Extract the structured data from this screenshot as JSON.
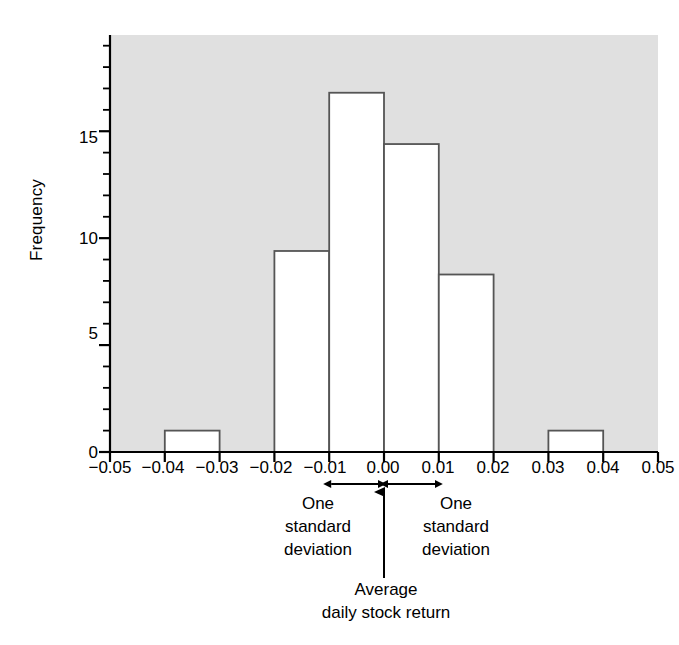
{
  "chart_data": {
    "type": "bar",
    "title": "",
    "subtitle": "",
    "xlabel": "",
    "ylabel": "Frequency",
    "grid": false,
    "legend": null,
    "xlim": [
      -0.05,
      0.05
    ],
    "ylim": [
      0,
      19.5
    ],
    "bin_width": 0.01,
    "x_tick_labels": [
      "−0.05",
      "−0.04",
      "−0.03",
      "−0.02",
      "−0.01",
      "0.00",
      "0.01",
      "0.02",
      "0.03",
      "0.04",
      "0.05"
    ],
    "x_tick_values": [
      -0.05,
      -0.04,
      -0.03,
      -0.02,
      -0.01,
      0.0,
      0.01,
      0.02,
      0.03,
      0.04,
      0.05
    ],
    "y_tick_labels": [
      "0",
      "5",
      "10",
      "15"
    ],
    "y_tick_values": [
      0,
      5,
      10,
      15
    ],
    "y_minor_tick_step": 1,
    "categories": [
      "−0.05 to −0.04",
      "−0.04 to −0.03",
      "−0.03 to −0.02",
      "−0.02 to −0.01",
      "−0.01 to 0.00",
      "0.00 to 0.01",
      "0.01 to 0.02",
      "0.02 to 0.03",
      "0.03 to 0.04",
      "0.04 to 0.05"
    ],
    "bins": [
      {
        "x0": -0.05,
        "x1": -0.04,
        "value": 0
      },
      {
        "x0": -0.04,
        "x1": -0.03,
        "value": 1
      },
      {
        "x0": -0.03,
        "x1": -0.02,
        "value": 0
      },
      {
        "x0": -0.02,
        "x1": -0.01,
        "value": 9.4
      },
      {
        "x0": -0.01,
        "x1": 0.0,
        "value": 16.8
      },
      {
        "x0": 0.0,
        "x1": 0.01,
        "value": 14.4
      },
      {
        "x0": 0.01,
        "x1": 0.02,
        "value": 8.3
      },
      {
        "x0": 0.02,
        "x1": 0.03,
        "value": 0
      },
      {
        "x0": 0.03,
        "x1": 0.04,
        "value": 1
      },
      {
        "x0": 0.04,
        "x1": 0.05,
        "value": 0
      }
    ],
    "values": [
      0,
      1,
      0,
      9.4,
      16.8,
      14.4,
      8.3,
      0,
      1,
      0
    ],
    "plot_background_color": "#e0e0e0",
    "bar_fill_color": "#ffffff",
    "bar_edge_color": "#555555",
    "axis_color": "#000000",
    "annotations": [
      {
        "name": "sd-left",
        "text": "One standard deviation",
        "lines": [
          "One",
          "standard",
          "deviation"
        ],
        "span": [
          -0.01,
          0.0
        ],
        "arrow": "double-headed"
      },
      {
        "name": "sd-right",
        "text": "One standard deviation",
        "lines": [
          "One",
          "standard",
          "deviation"
        ],
        "span": [
          0.0,
          0.01
        ],
        "arrow": "double-headed"
      },
      {
        "name": "mean-pointer",
        "text": "Average daily stock return",
        "lines": [
          "Average",
          "daily stock return"
        ],
        "at": 0.0,
        "arrow": "up"
      }
    ]
  },
  "axes": {
    "y_title": "Frequency",
    "y_ticks": [
      {
        "label": "0",
        "value": 0
      },
      {
        "label": "5",
        "value": 5
      },
      {
        "label": "10",
        "value": 10
      },
      {
        "label": "15",
        "value": 15
      }
    ],
    "x_ticks": [
      {
        "label": "−0.05",
        "value": -0.05
      },
      {
        "label": "−0.04",
        "value": -0.04
      },
      {
        "label": "−0.03",
        "value": -0.03
      },
      {
        "label": "−0.02",
        "value": -0.02
      },
      {
        "label": "−0.01",
        "value": -0.01
      },
      {
        "label": "0.00",
        "value": 0.0
      },
      {
        "label": "0.01",
        "value": 0.01
      },
      {
        "label": "0.02",
        "value": 0.02
      },
      {
        "label": "0.03",
        "value": 0.03
      },
      {
        "label": "0.04",
        "value": 0.04
      },
      {
        "label": "0.05",
        "value": 0.05
      }
    ]
  },
  "annotations_text": {
    "sd_left_line1": "One",
    "sd_left_line2": "standard",
    "sd_left_line3": "deviation",
    "sd_right_line1": "One",
    "sd_right_line2": "standard",
    "sd_right_line3": "deviation",
    "mean_line1": "Average",
    "mean_line2": "daily stock return"
  },
  "colors": {
    "plot_background": "#e0e0e0",
    "bar_fill": "#ffffff",
    "bar_edge": "#555555",
    "axis": "#000000",
    "text": "#000000"
  }
}
